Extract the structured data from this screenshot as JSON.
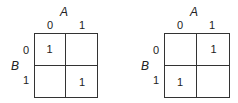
{
  "maps": [
    {
      "col_var": "A",
      "row_var": "B",
      "col_labels": [
        "0",
        "1"
      ],
      "row_labels": [
        "0",
        "1"
      ],
      "cells": [
        [
          "1",
          ""
        ],
        [
          "",
          "1"
        ]
      ]
    },
    {
      "col_var": "A",
      "row_var": "B",
      "col_labels": [
        "0",
        "1"
      ],
      "row_labels": [
        "0",
        "1"
      ],
      "cells": [
        [
          "",
          "1"
        ],
        [
          "1",
          ""
        ]
      ]
    }
  ]
}
